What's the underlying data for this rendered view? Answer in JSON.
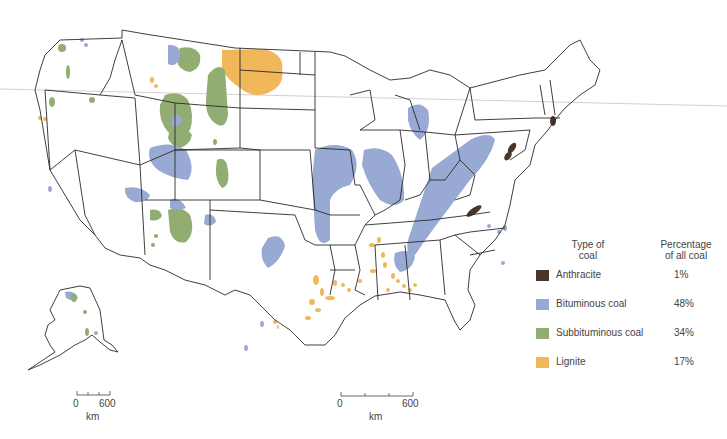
{
  "map": {
    "title": "Coal deposits of the United States",
    "region": "Contiguous United States with Alaska inset"
  },
  "legend": {
    "col1_header": "Type of coal",
    "col1_header_line1": "Type of",
    "col1_header_line2": "coal",
    "col2_header_line1": "Percentage",
    "col2_header_line2": "of all coal",
    "items": [
      {
        "label": "Anthracite",
        "percent": "1%",
        "color": "#4a3528"
      },
      {
        "label": "Bituminous coal",
        "percent": "48%",
        "color": "#98a9d4"
      },
      {
        "label": "Subbituminous coal",
        "percent": "34%",
        "color": "#92ad72"
      },
      {
        "label": "Lignite",
        "percent": "17%",
        "color": "#f0b85a"
      }
    ]
  },
  "scale_alaska": {
    "start": "0",
    "end": "600",
    "unit": "km"
  },
  "scale_main": {
    "start": "0",
    "end": "600",
    "unit": "km"
  }
}
